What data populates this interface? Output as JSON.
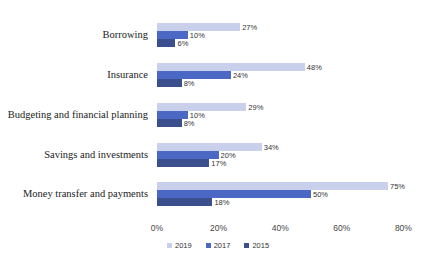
{
  "chart_data": {
    "type": "bar",
    "orientation": "horizontal",
    "title": "",
    "xlabel": "",
    "ylabel": "",
    "categories": [
      "Borrowing",
      "Insurance",
      "Budgeting and financial planning",
      "Savings and investments",
      "Money transfer and payments"
    ],
    "series": [
      {
        "name": "2019",
        "color": "#c9d0ec",
        "values": [
          27,
          48,
          29,
          34,
          75
        ],
        "labels": [
          "27%",
          "48%",
          "29%",
          "34%",
          "75%"
        ]
      },
      {
        "name": "2017",
        "color": "#4a68c4",
        "values": [
          10,
          24,
          10,
          20,
          50
        ],
        "labels": [
          "10%",
          "24%",
          "10%",
          "20%",
          "50%"
        ]
      },
      {
        "name": "2015",
        "color": "#3b4e8e",
        "values": [
          6,
          8,
          8,
          17,
          18
        ],
        "labels": [
          "6%",
          "8%",
          "8%",
          "17%",
          "18%"
        ]
      }
    ],
    "xlim": [
      0,
      80
    ],
    "xticks": [
      "0%",
      "20%",
      "40%",
      "60%",
      "80%"
    ],
    "grid": false,
    "legend_position": "bottom"
  }
}
